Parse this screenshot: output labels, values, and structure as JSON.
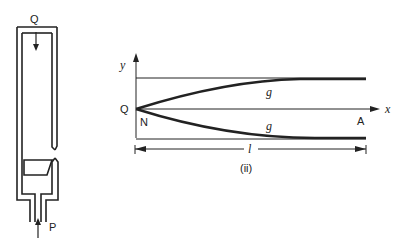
{
  "figure_left": {
    "labels": {
      "top": "Q",
      "bottom": "P"
    }
  },
  "figure_right": {
    "labels": {
      "y_axis": "y",
      "x_axis": "x",
      "origin": "Q",
      "origin_sub": "N",
      "end": "A",
      "upper_curve": "g",
      "lower_curve": "g",
      "length": "l",
      "caption": "(ii)"
    }
  },
  "colors": {
    "ink": "#222222",
    "background": "#ffffff"
  }
}
